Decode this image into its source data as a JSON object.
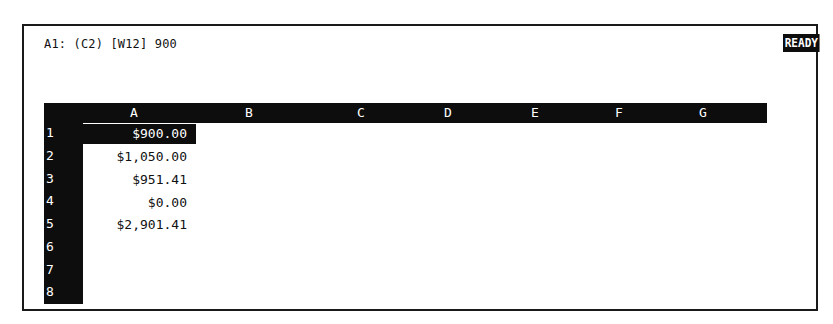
{
  "status_bar": {
    "cell_info": "A1: (C2) [W12] 900",
    "mode": "READY"
  },
  "columns": [
    {
      "label": "A",
      "x": 134
    },
    {
      "label": "B",
      "x": 249
    },
    {
      "label": "C",
      "x": 361
    },
    {
      "label": "D",
      "x": 448
    },
    {
      "label": "E",
      "x": 535
    },
    {
      "label": "F",
      "x": 619
    },
    {
      "label": "G",
      "x": 703
    }
  ],
  "rows": [
    {
      "num": "1",
      "a": "$900.00",
      "selected": true
    },
    {
      "num": "2",
      "a": "$1,050.00",
      "selected": false
    },
    {
      "num": "3",
      "a": "$951.41",
      "selected": false
    },
    {
      "num": "4",
      "a": "$0.00",
      "selected": false
    },
    {
      "num": "5",
      "a": "$2,901.41",
      "selected": false
    },
    {
      "num": "6",
      "a": "",
      "selected": false
    },
    {
      "num": "7",
      "a": "",
      "selected": false
    },
    {
      "num": "8",
      "a": "",
      "selected": false
    }
  ],
  "colors": {
    "inverse_bg": "#0d0d0d",
    "inverse_fg": "#ffffff",
    "screen_bg": "#ffffff",
    "text": "#111111"
  }
}
